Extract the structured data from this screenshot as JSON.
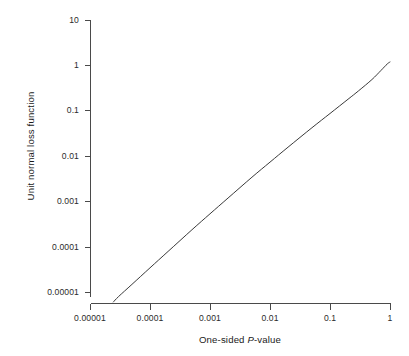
{
  "chart_data": {
    "type": "line",
    "title": "",
    "xlabel": "One-sided P-value",
    "xlabel_parts": {
      "before": "One-sided ",
      "italic": "P",
      "after": "-value"
    },
    "ylabel": "Unit normal loss function",
    "xscale": "log",
    "yscale": "log",
    "xlim": [
      1e-05,
      1
    ],
    "ylim": [
      1e-05,
      10
    ],
    "grid": false,
    "legend": null,
    "xticks": [
      1e-05,
      0.0001,
      0.001,
      0.01,
      0.1,
      1
    ],
    "xtick_labels": [
      "0.00001",
      "0.0001",
      "0.001",
      "0.01",
      "0.1",
      "1"
    ],
    "yticks": [
      1e-05,
      0.0001,
      0.001,
      0.01,
      0.1,
      1,
      10
    ],
    "ytick_labels": [
      "0.00001",
      "0.0001",
      "0.001",
      "0.01",
      "0.1",
      "1",
      "10"
    ],
    "series": [
      {
        "name": "unit normal loss function",
        "color": "#3a3a3a",
        "linewidth": 1,
        "x": [
          2.45e-05,
          3e-05,
          5e-05,
          0.0001,
          0.0002,
          0.0005,
          0.001,
          0.002,
          0.005,
          0.01,
          0.02,
          0.05,
          0.1,
          0.2,
          0.3,
          0.5,
          0.7,
          0.9,
          1.0
        ],
        "y": [
          1e-05,
          1.31e-05,
          2.37e-05,
          5.33e-05,
          0.000119,
          0.000344,
          0.000752,
          0.00163,
          0.00452,
          0.00946,
          0.0197,
          0.051,
          0.1025,
          0.2064,
          0.312,
          0.5411,
          0.8332,
          1.161,
          1.276
        ]
      }
    ],
    "x_pixels": {
      "min": 90,
      "max": 390
    },
    "y_pixels": {
      "min": 20,
      "max": 302
    }
  },
  "axis": {
    "x_tick_labels": [
      "0.00001",
      "0.0001",
      "0.001",
      "0.01",
      "0.1",
      "1"
    ],
    "y_tick_labels": [
      "10",
      "1",
      "0.1",
      "0.01",
      "0.001",
      "0.0001",
      "0.00001"
    ]
  }
}
